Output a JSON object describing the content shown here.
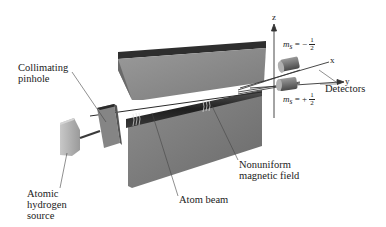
{
  "diagram": {
    "labels": {
      "collimating_pinhole_line1": "Collimating",
      "collimating_pinhole_line2": "pinhole",
      "source_line1": "Atomic",
      "source_line2": "hydrogen",
      "source_line3": "source",
      "atom_beam": "Atom beam",
      "field_line1": "Nonuniform",
      "field_line2": "magnetic field",
      "detectors": "Detectors"
    },
    "axes": {
      "z": "z",
      "x": "x",
      "y": "y"
    },
    "states": {
      "upper": {
        "symbol": "m",
        "subscript": "s",
        "sign": "= −",
        "numerator": "1",
        "denominator": "2"
      },
      "lower": {
        "symbol": "m",
        "subscript": "s",
        "sign": "= +",
        "numerator": "1",
        "denominator": "2"
      }
    },
    "colors": {
      "magnet_top": "#3a3a3a",
      "magnet_face": "#8a8a8a",
      "magnet_side": "#6e6e6e",
      "source": "#b5b5b5",
      "beam": "#2a2a2a",
      "label_text": "#222222"
    }
  }
}
